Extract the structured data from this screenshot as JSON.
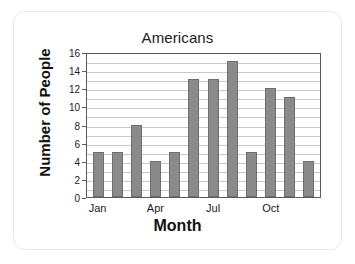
{
  "chart_data": {
    "type": "bar",
    "title": "Americans",
    "xlabel": "Month",
    "ylabel": "Number of People",
    "categories": [
      "Jan",
      "Feb",
      "Mar",
      "Apr",
      "May",
      "Jun",
      "Jul",
      "Aug",
      "Sep",
      "Oct",
      "Nov",
      "Dec"
    ],
    "values": [
      5,
      5,
      8,
      4,
      5,
      13,
      13,
      15,
      5,
      12,
      11,
      4
    ],
    "visible_xtick_labels": [
      "Jan",
      "Apr",
      "Jul",
      "Oct"
    ],
    "visible_xtick_indices": [
      0,
      3,
      6,
      9
    ],
    "ytick_labels": [
      "0",
      "2",
      "4",
      "6",
      "8",
      "10",
      "12",
      "14",
      "16"
    ],
    "ytick_values": [
      0,
      2,
      4,
      6,
      8,
      10,
      12,
      14,
      16
    ],
    "ylim": [
      0,
      16
    ],
    "grid": true,
    "gridline_step": 1,
    "legend": null,
    "bar_color": "#8a8a8a",
    "bar_edge_color": "#6e6e6e",
    "frame_color": "#5a5a5a",
    "grid_color": "#c9c9c9",
    "background": "#ffffff"
  }
}
